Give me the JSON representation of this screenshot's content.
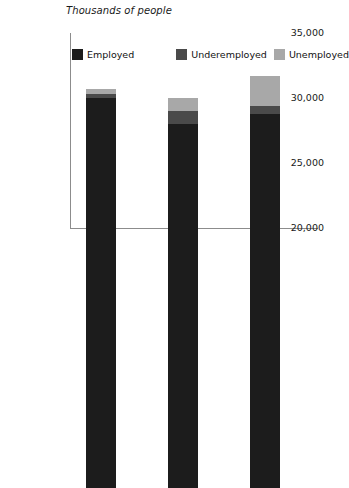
{
  "chart_data": {
    "type": "bar",
    "subtype": "stacked-column",
    "title": "",
    "xlabel": "",
    "ylabel": "Thousands of people",
    "categories": [
      "1997",
      "1998",
      "1999"
    ],
    "series": [
      {
        "name": "Employed",
        "color": "#1c1c1c",
        "values": [
          30000,
          28000,
          28800
        ]
      },
      {
        "name": "Underemployed",
        "color": "#4a4a4a",
        "values": [
          300,
          1000,
          600
        ]
      },
      {
        "name": "Unemployed",
        "color": "#a8a8a8",
        "values": [
          400,
          1000,
          2300
        ]
      }
    ],
    "totals": [
      30700,
      30000,
      31700
    ],
    "ylim": [
      20000,
      35000
    ],
    "yticks": [
      20000,
      25000,
      30000,
      35000
    ],
    "ytick_labels": [
      "20,000",
      "25,000",
      "30,000",
      "35,000"
    ],
    "grid": false,
    "legend_position": "top-inside"
  },
  "axis": {
    "title": "Thousands of people",
    "axis_color": "#8c8c8c"
  },
  "legend": {
    "items": [
      {
        "label": "Employed",
        "color": "#1c1c1c"
      },
      {
        "label": "Underemployed",
        "color": "#4a4a4a"
      },
      {
        "label": "Unemployed",
        "color": "#a8a8a8"
      }
    ]
  }
}
